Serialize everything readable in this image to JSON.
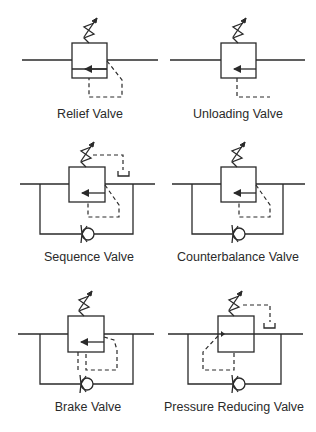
{
  "diagram": {
    "type": "hydraulic pressure control valve symbols",
    "colors": {
      "line": "#2a2a2a",
      "background": "#ffffff"
    },
    "valves": [
      {
        "id": "relief",
        "label": "Relief Valve"
      },
      {
        "id": "unloading",
        "label": "Unloading Valve"
      },
      {
        "id": "sequence",
        "label": "Sequence Valve"
      },
      {
        "id": "counterbalance",
        "label": "Counterbalance Valve"
      },
      {
        "id": "brake",
        "label": "Brake Valve"
      },
      {
        "id": "pressure-reducing",
        "label": "Pressure Reducing Valve"
      }
    ]
  }
}
